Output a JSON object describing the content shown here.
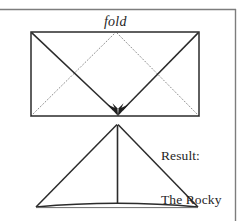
{
  "figure": {
    "kind": "paper-folding-diagram",
    "title_text": "fold",
    "caption_lines": [
      "Result:",
      "The Rocky",
      "Mountains"
    ],
    "caption_full": "Result: The Rocky Mountains",
    "colors": {
      "background": "#ffffff",
      "ink": "#1f1f1f",
      "solid_stroke": "#2b2b2b",
      "dotted_stroke": "#8f8f8f",
      "border_rule": "#7d7d7d"
    },
    "border": {
      "top_rule_label": "top-rule",
      "right_rule_label": "right-rule"
    },
    "sheet": {
      "label": "paper-sheet-rectangle",
      "left": 31,
      "top": 32,
      "right": 199,
      "bottom": 116
    },
    "solid_fold_lines": [
      {
        "label": "fold-line-from-top-left",
        "x1": 31,
        "y1": 32,
        "x2": 118,
        "y2": 114
      },
      {
        "label": "fold-line-from-top-right",
        "x1": 199,
        "y1": 32,
        "x2": 118,
        "y2": 114
      }
    ],
    "dotted_fold_lines": [
      {
        "label": "crease-from-bottom-left",
        "x1": 31,
        "y1": 116,
        "x2": 115,
        "y2": 33
      },
      {
        "label": "crease-from-bottom-right",
        "x1": 199,
        "y1": 116,
        "x2": 117,
        "y2": 33
      }
    ],
    "arrows": {
      "label": "fold-direction-arrows",
      "count": 2,
      "converge_x": 118,
      "converge_y": 115
    },
    "result_shape": {
      "label": "folded-mountain-triangle",
      "apex_x": 117,
      "apex_y": 124,
      "base_left_x": 36,
      "base_right_x": 198,
      "base_y": 207,
      "center_crease_label": "center-crease-line",
      "base_curve_label": "curved-base-edge"
    }
  }
}
